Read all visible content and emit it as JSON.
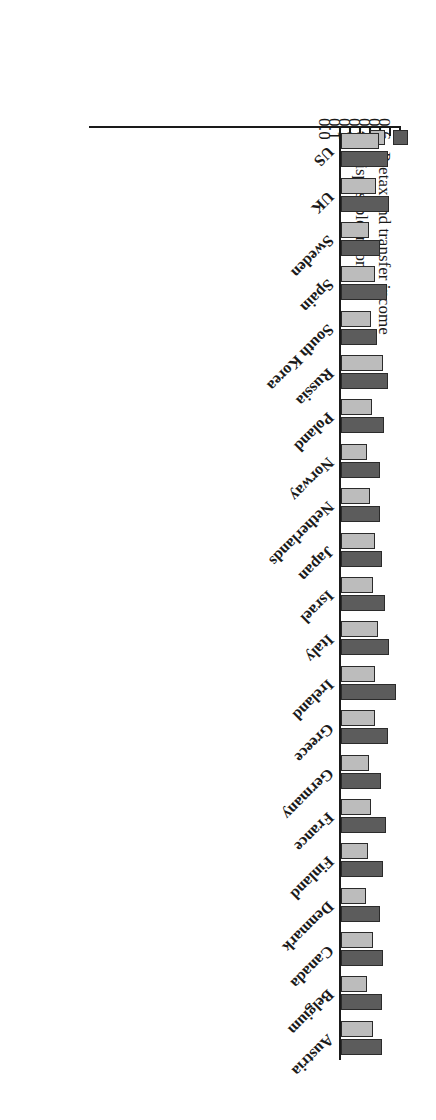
{
  "chart_data": {
    "type": "bar",
    "orientation": "horizontal",
    "title": "",
    "xlabel": "",
    "ylabel": "",
    "xlim": [
      0.0,
      0.6
    ],
    "xticks": [
      0.0,
      0.1,
      0.2,
      0.3,
      0.4,
      0.5,
      0.6
    ],
    "xtick_labels": [
      "0.0",
      "0.1",
      "0.2",
      "0.3",
      "0.4",
      "0.5",
      "0.6"
    ],
    "grid": false,
    "rotated_180": true,
    "legend_position": "bottom-left",
    "categories": [
      "Austria",
      "Belgium",
      "Canada",
      "Denmark",
      "Finland",
      "France",
      "Germany",
      "Greece",
      "Ireland",
      "Italy",
      "Israel",
      "Japan",
      "Netherlands",
      "Norway",
      "Poland",
      "Russia",
      "South Korea",
      "Spain",
      "Sweden",
      "UK",
      "US"
    ],
    "series": [
      {
        "name": "Pretax and transfer income",
        "color": "#5c5c5c",
        "values": [
          0.413,
          0.413,
          0.419,
          0.39,
          0.417,
          0.449,
          0.403,
          0.472,
          0.555,
          0.476,
          0.439,
          0.411,
          0.394,
          0.394,
          0.429,
          0.466,
          0.364,
          0.457,
          0.39,
          0.482,
          0.468
        ]
      },
      {
        "name": "Disposable income",
        "color": "#bcbcbc",
        "values": [
          0.319,
          0.259,
          0.325,
          0.246,
          0.266,
          0.303,
          0.285,
          0.343,
          0.341,
          0.37,
          0.323,
          0.339,
          0.295,
          0.26,
          0.311,
          0.423,
          0.301,
          0.339,
          0.276,
          0.35,
          0.384
        ]
      }
    ],
    "legend": [
      {
        "label": "Pretax and transfer income",
        "swatch": "#5c5c5c"
      },
      {
        "label": "Disposable income",
        "swatch": "#bcbcbc"
      }
    ]
  }
}
